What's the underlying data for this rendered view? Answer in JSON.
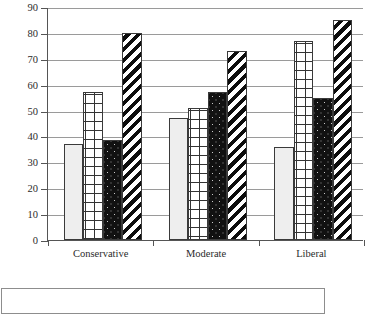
{
  "chart_data": {
    "type": "bar",
    "title": "",
    "subtitle": "",
    "xlabel": "",
    "ylabel": "",
    "categories": [
      "Conservative",
      "Moderate",
      "Liberal"
    ],
    "series": [
      {
        "name": "Series 1",
        "pattern": "plain-light-gray",
        "values": [
          37,
          47,
          36
        ]
      },
      {
        "name": "Series 2",
        "pattern": "crosshatch-grid",
        "values": [
          57,
          51,
          77
        ]
      },
      {
        "name": "Series 3",
        "pattern": "black-speckled",
        "values": [
          38.5,
          57,
          55
        ]
      },
      {
        "name": "Series 4",
        "pattern": "diagonal-stripes",
        "values": [
          80,
          73,
          85
        ]
      }
    ],
    "ylim": [
      0,
      90
    ],
    "ytick_step": 10,
    "yticks": [
      0,
      10,
      20,
      30,
      40,
      50,
      60,
      70,
      80,
      90
    ],
    "ytick_labels": [
      "0",
      "10",
      "20",
      "30",
      "40",
      "50",
      "60",
      "70",
      "80",
      "90"
    ],
    "grid": true,
    "grid_axis": "y",
    "legend_position": "bottom",
    "legend_entries": [],
    "annotations": []
  },
  "colors": {
    "axis": "#555555",
    "gridline": "#9a9a9a",
    "bar_outline": "#3a3a3a",
    "background": "#ffffff",
    "text": "#2b2b2b"
  },
  "legend": {
    "label": ""
  }
}
